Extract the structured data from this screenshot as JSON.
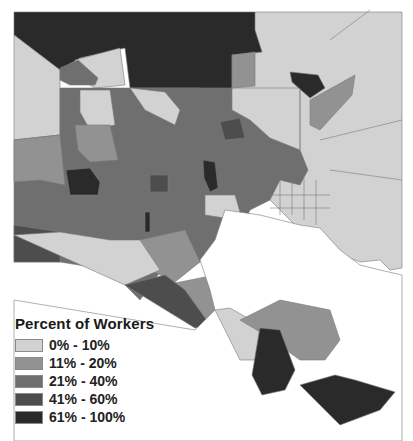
{
  "map": {
    "subject": "Baltimore census tracts choropleth",
    "background": "#ffffff",
    "water_color": "#ffffff",
    "border_color": "#7a7a7a"
  },
  "legend": {
    "title": "Percent of Workers",
    "items": [
      {
        "label": "0% - 10%",
        "color": "#d2d2d2"
      },
      {
        "label": "11% - 20%",
        "color": "#929292"
      },
      {
        "label": "21% - 40%",
        "color": "#6f6f6f"
      },
      {
        "label": "41% - 60%",
        "color": "#4d4d4d"
      },
      {
        "label": "61% - 100%",
        "color": "#2a2a2a"
      }
    ]
  }
}
